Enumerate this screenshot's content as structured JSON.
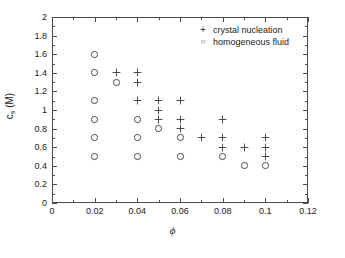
{
  "chart_data": {
    "type": "scatter",
    "title": "",
    "xlabel": "ϕ",
    "ylabel": "c_s (M)",
    "xlim": [
      0,
      0.12
    ],
    "ylim": [
      0,
      2
    ],
    "xticks": [
      "0",
      "0.02",
      "0.04",
      "0.06",
      "0.08",
      "0.1",
      "0.12"
    ],
    "xtick_values": [
      0,
      0.02,
      0.04,
      0.06,
      0.08,
      0.1,
      0.12
    ],
    "yticks": [
      "0",
      "0.2",
      "0.4",
      "0.6",
      "0.8",
      "1",
      "1.2",
      "1.4",
      "1.6",
      "1.8",
      "2"
    ],
    "ytick_values": [
      0,
      0.2,
      0.4,
      0.6,
      0.8,
      1,
      1.2,
      1.4,
      1.6,
      1.8,
      2
    ],
    "grid": false,
    "minor_ticks": true,
    "legend_position": "top-right",
    "series": [
      {
        "name": "crystal nucleation",
        "marker": "plus",
        "color": "#3a3a3a",
        "points": [
          [
            0.03,
            1.4
          ],
          [
            0.04,
            1.4
          ],
          [
            0.04,
            1.3
          ],
          [
            0.04,
            1.1
          ],
          [
            0.05,
            1.1
          ],
          [
            0.05,
            1.0
          ],
          [
            0.05,
            0.9
          ],
          [
            0.06,
            1.1
          ],
          [
            0.06,
            0.9
          ],
          [
            0.06,
            0.8
          ],
          [
            0.07,
            0.7
          ],
          [
            0.08,
            0.9
          ],
          [
            0.08,
            0.7
          ],
          [
            0.08,
            0.6
          ],
          [
            0.09,
            0.6
          ],
          [
            0.1,
            0.7
          ],
          [
            0.1,
            0.6
          ],
          [
            0.1,
            0.5
          ]
        ]
      },
      {
        "name": "homogeneous fluid",
        "marker": "circle",
        "color": "#3a3a3a",
        "points": [
          [
            0.02,
            1.6
          ],
          [
            0.02,
            1.4
          ],
          [
            0.02,
            1.1
          ],
          [
            0.02,
            0.9
          ],
          [
            0.02,
            0.7
          ],
          [
            0.02,
            0.5
          ],
          [
            0.03,
            1.3
          ],
          [
            0.04,
            0.9
          ],
          [
            0.04,
            0.7
          ],
          [
            0.04,
            0.5
          ],
          [
            0.05,
            0.8
          ],
          [
            0.06,
            0.7
          ],
          [
            0.06,
            0.5
          ],
          [
            0.08,
            0.5
          ],
          [
            0.09,
            0.4
          ],
          [
            0.1,
            0.4
          ]
        ]
      }
    ],
    "legend": [
      {
        "marker": "+",
        "label": "crystal nucleation"
      },
      {
        "marker": "○",
        "label": "homogeneous fluid"
      }
    ]
  }
}
